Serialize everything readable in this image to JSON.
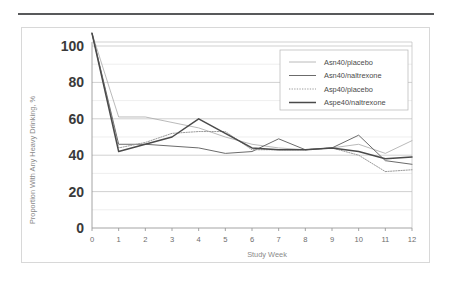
{
  "figure": {
    "top_rule": "horizontal-rule"
  },
  "chart_data": {
    "type": "line",
    "title": "",
    "xlabel": "Study Week",
    "ylabel": "Proportion With Any Heavy Drinking, %",
    "x": [
      0,
      1,
      2,
      3,
      4,
      5,
      6,
      7,
      8,
      9,
      10,
      11,
      12
    ],
    "xlim": [
      0,
      12
    ],
    "ylim": [
      0,
      100
    ],
    "yticks": [
      0,
      20,
      40,
      60,
      80,
      100
    ],
    "ytick_labels": [
      "0",
      "20",
      "40",
      "60",
      "80",
      "100"
    ],
    "xticks": [
      0,
      1,
      2,
      3,
      4,
      5,
      6,
      7,
      8,
      9,
      10,
      11,
      12
    ],
    "xtick_labels": [
      "0",
      "1",
      "2",
      "3",
      "4",
      "5",
      "6",
      "7",
      "8",
      "9",
      "10",
      "11",
      "12"
    ],
    "minor_yticks": [
      10,
      30,
      50,
      70,
      90
    ],
    "grid": true,
    "legend_position": "top-right",
    "series": [
      {
        "name": "Asn40/placebo",
        "style": "solid-thin-light",
        "color": "#a8a8a8",
        "width": 0.8,
        "dash": "none",
        "values": [
          107,
          61,
          61,
          58,
          55,
          50,
          46,
          44,
          43,
          44,
          46,
          41,
          48
        ]
      },
      {
        "name": "Asn40/naltrexone",
        "style": "solid-medium",
        "color": "#6b6b6b",
        "width": 1.0,
        "dash": "none",
        "values": [
          107,
          46,
          46,
          45,
          44,
          41,
          42,
          49,
          43,
          44,
          51,
          37,
          35
        ]
      },
      {
        "name": "Asp40/placebo",
        "style": "dotted-light",
        "color": "#9b9b9b",
        "width": 1.0,
        "dash": "1.3,1.3",
        "values": [
          107,
          44,
          47,
          52,
          53,
          53,
          43,
          43,
          43,
          44,
          40,
          31,
          32
        ]
      },
      {
        "name": "Aspe40/naltrexone",
        "style": "solid-thick-dark",
        "color": "#4a4a4a",
        "width": 1.5,
        "dash": "none",
        "values": [
          107,
          42,
          46,
          50,
          60,
          52,
          44,
          43,
          43,
          44,
          42,
          38,
          39
        ]
      }
    ]
  },
  "legend": {
    "items": [
      {
        "label": "Asn40/placebo"
      },
      {
        "label": "Asn40/naltrexone"
      },
      {
        "label": "Asp40/placebo"
      },
      {
        "label": "Aspe40/naltrexone"
      }
    ]
  }
}
